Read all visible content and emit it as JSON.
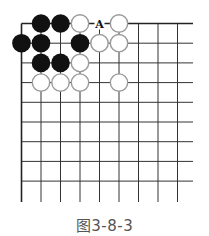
{
  "diagram": {
    "type": "go-board-partial",
    "caption": "图3-8-3",
    "grid": {
      "columns": 9,
      "rows": 9,
      "origin_x": 21.5,
      "origin_y": 23.5,
      "spacing_x": 19.5,
      "spacing_y": 19.7,
      "extend_right_to": 193,
      "extend_bottom_to": 202,
      "line_color": "#333333",
      "edge_color": "#222222"
    },
    "stones": [
      {
        "color": "black",
        "col": 1,
        "row": 0
      },
      {
        "color": "black",
        "col": 2,
        "row": 0
      },
      {
        "color": "white",
        "col": 3,
        "row": 0
      },
      {
        "color": "white",
        "col": 5,
        "row": 0
      },
      {
        "color": "black",
        "col": 0,
        "row": 1
      },
      {
        "color": "black",
        "col": 1,
        "row": 1
      },
      {
        "color": "black",
        "col": 3,
        "row": 1
      },
      {
        "color": "white",
        "col": 4,
        "row": 1
      },
      {
        "color": "white",
        "col": 5,
        "row": 1
      },
      {
        "color": "black",
        "col": 1,
        "row": 2
      },
      {
        "color": "black",
        "col": 2,
        "row": 2
      },
      {
        "color": "white",
        "col": 3,
        "row": 2
      },
      {
        "color": "white",
        "col": 1,
        "row": 3
      },
      {
        "color": "white",
        "col": 2,
        "row": 3
      },
      {
        "color": "white",
        "col": 3,
        "row": 3
      },
      {
        "color": "white",
        "col": 5,
        "row": 3
      }
    ],
    "labels": [
      {
        "text": "A",
        "col": 4,
        "row": 0
      }
    ],
    "colors": {
      "black_stone": "#111111",
      "white_stone_fill": "#ffffff",
      "white_stone_stroke": "#9a9a9a",
      "label": "#111111",
      "caption": "#555555"
    }
  }
}
